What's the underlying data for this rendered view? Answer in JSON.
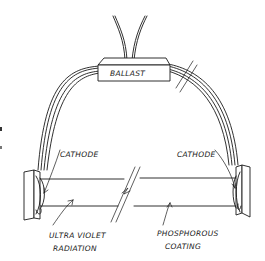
{
  "diagram": {
    "colors": {
      "ink": "#1a1a1a",
      "background": "#ffffff"
    },
    "labels": {
      "ballast": "BALLAST",
      "cathode_left": "CATHODE",
      "cathode_right": "CATHODE",
      "uv_line1": "ULTRA VIOLET",
      "uv_line2": "RADIATION",
      "phosphor_line1": "PHOSPHOROUS",
      "phosphor_line2": "COATING"
    }
  }
}
